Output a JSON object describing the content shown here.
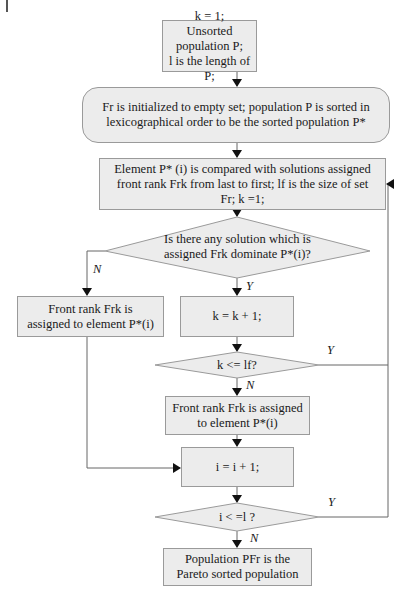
{
  "flowchart": {
    "start": {
      "line1": "k = 1;",
      "line2": "Unsorted population P;",
      "line3": "l is the length of P;"
    },
    "init": {
      "line1": "Fr is initialized to empty set; population P is sorted in",
      "line2": "lexicographical order to be the sorted population P*"
    },
    "compare": {
      "line1": "Element P* (i) is compared with solutions assigned",
      "line2": "front rank Frk from last to first; lf is the size of set",
      "line3": "Fr; k =1;"
    },
    "decision_dominate": {
      "line1": "Is there any solution which is",
      "line2": "assigned Frk dominate P*(i)?"
    },
    "assign_left": {
      "line1": "Front rank Frk is",
      "line2": "assigned to element P*(i)"
    },
    "increment_k": {
      "text": "k = k + 1;"
    },
    "decision_k": {
      "text": "k <= lf?"
    },
    "assign_main": {
      "line1": "Front rank Frk is assigned",
      "line2": "to element P*(i)"
    },
    "increment_i": {
      "text": "i = i + 1;"
    },
    "decision_i": {
      "text": "i < =l ?"
    },
    "end": {
      "line1": "Population PFr is the",
      "line2": "Pareto sorted population"
    },
    "edge_labels": {
      "n1": "N",
      "y1": "Y",
      "y2": "Y",
      "n2": "N",
      "y3": "Y",
      "n3": "N"
    }
  },
  "colors": {
    "box_fill": "#ececec",
    "box_stroke": "#9a9a9a",
    "line": "#555555",
    "arrow": "#111111"
  }
}
